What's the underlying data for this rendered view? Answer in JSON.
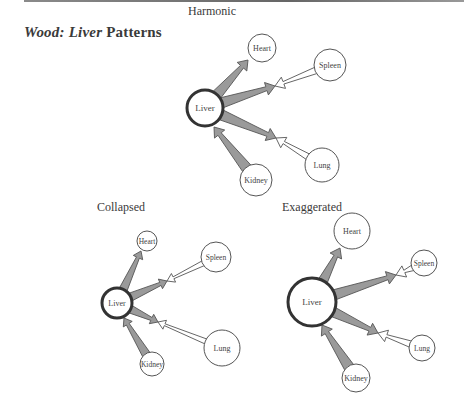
{
  "page": {
    "title_parts": [
      "Wood:",
      "Liver",
      "Patterns"
    ]
  },
  "colors": {
    "arrow_fill": "#9a9a9a",
    "arrow_stroke": "#555555",
    "counter_arrow_fill": "#ffffff",
    "node_stroke": "#555555",
    "center_node_stroke": "#333333",
    "background": "#ffffff"
  },
  "diagrams": [
    {
      "id": "harmonic",
      "label": "Harmonic",
      "label_pos": [
        188,
        4
      ],
      "nodes": [
        {
          "name": "Liver",
          "x": 205,
          "y": 108,
          "r": 18,
          "center": true,
          "font": 9
        },
        {
          "name": "Heart",
          "x": 262,
          "y": 48,
          "r": 14,
          "center": false,
          "font": 8
        },
        {
          "name": "Spleen",
          "x": 330,
          "y": 65,
          "r": 16,
          "center": false,
          "font": 8
        },
        {
          "name": "Lung",
          "x": 322,
          "y": 165,
          "r": 17,
          "center": false,
          "font": 8
        },
        {
          "name": "Kidney",
          "x": 256,
          "y": 180,
          "r": 16,
          "center": false,
          "font": 8
        }
      ],
      "arrows": [
        {
          "from": "Liver",
          "to": "Heart",
          "kind": "gray",
          "end": [
            248,
            60
          ]
        },
        {
          "from": "Liver",
          "to": "Spleen",
          "kind": "gray",
          "end": [
            275,
            86
          ]
        },
        {
          "from": "Spleen",
          "to": "Liver",
          "kind": "white",
          "end": [
            275,
            86
          ]
        },
        {
          "from": "Liver",
          "to": "Lung",
          "kind": "gray",
          "end": [
            276,
            138
          ]
        },
        {
          "from": "Lung",
          "to": "Liver",
          "kind": "white",
          "end": [
            276,
            138
          ]
        },
        {
          "from": "Kidney",
          "to": "Liver",
          "kind": "gray",
          "end": [
            214,
            127
          ]
        }
      ]
    },
    {
      "id": "collapsed",
      "label": "Collapsed",
      "label_pos": [
        97,
        200
      ],
      "nodes": [
        {
          "name": "Liver",
          "x": 117,
          "y": 303,
          "r": 15,
          "center": true,
          "font": 8
        },
        {
          "name": "Heart",
          "x": 147,
          "y": 241,
          "r": 10,
          "center": false,
          "font": 7.5
        },
        {
          "name": "Spleen",
          "x": 216,
          "y": 257,
          "r": 15,
          "center": false,
          "font": 7.5
        },
        {
          "name": "Lung",
          "x": 222,
          "y": 348,
          "r": 18,
          "center": false,
          "font": 8
        },
        {
          "name": "Kidney",
          "x": 152,
          "y": 364,
          "r": 12,
          "center": false,
          "font": 7.5
        }
      ],
      "arrows": [
        {
          "from": "Liver",
          "to": "Heart",
          "kind": "gray",
          "end": [
            141,
            251
          ]
        },
        {
          "from": "Liver",
          "to": "Spleen",
          "kind": "gray",
          "end": [
            167,
            281
          ]
        },
        {
          "from": "Spleen",
          "to": "Liver",
          "kind": "white",
          "end": [
            167,
            281
          ]
        },
        {
          "from": "Liver",
          "to": "Lung",
          "kind": "gray",
          "end": [
            158,
            322
          ]
        },
        {
          "from": "Lung",
          "to": "Liver",
          "kind": "white",
          "end": [
            158,
            322
          ]
        },
        {
          "from": "Kidney",
          "to": "Liver",
          "kind": "gray",
          "end": [
            124,
            318
          ]
        }
      ]
    },
    {
      "id": "exaggerated",
      "label": "Exaggerated",
      "label_pos": [
        282,
        200
      ],
      "nodes": [
        {
          "name": "Liver",
          "x": 312,
          "y": 302,
          "r": 24,
          "center": true,
          "font": 9
        },
        {
          "name": "Heart",
          "x": 352,
          "y": 231,
          "r": 18,
          "center": false,
          "font": 8
        },
        {
          "name": "Spleen",
          "x": 424,
          "y": 263,
          "r": 13,
          "center": false,
          "font": 7.5
        },
        {
          "name": "Lung",
          "x": 422,
          "y": 348,
          "r": 13,
          "center": false,
          "font": 7.5
        },
        {
          "name": "Kidney",
          "x": 356,
          "y": 378,
          "r": 14,
          "center": false,
          "font": 8
        }
      ],
      "arrows": [
        {
          "from": "Liver",
          "to": "Heart",
          "kind": "gray",
          "end": [
            340,
            248
          ]
        },
        {
          "from": "Liver",
          "to": "Spleen",
          "kind": "gray",
          "end": [
            396,
            275
          ]
        },
        {
          "from": "Spleen",
          "to": "Liver",
          "kind": "white",
          "end": [
            396,
            275
          ]
        },
        {
          "from": "Liver",
          "to": "Lung",
          "kind": "gray",
          "end": [
            378,
            333
          ]
        },
        {
          "from": "Lung",
          "to": "Liver",
          "kind": "white",
          "end": [
            378,
            333
          ]
        },
        {
          "from": "Kidney",
          "to": "Liver",
          "kind": "gray",
          "end": [
            322,
            325
          ]
        }
      ]
    }
  ]
}
